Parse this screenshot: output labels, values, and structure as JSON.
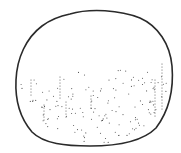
{
  "illustration": {
    "subject": "stippled round sphere drawing",
    "outline_color": "#2a2a2a",
    "dot_color": "#555555",
    "background": "#ffffff",
    "outline_path": "M70,14 C90,8 120,10 140,18 C158,26 170,44 172,66 C174,90 168,112 156,128 C142,142 118,146 90,146 C66,146 44,144 32,132 C20,118 15,100 16,80 C17,58 26,38 42,26 C50,20 60,16 70,14 Z",
    "dot_rows": [
      {
        "x": 31,
        "y0": 80,
        "y1": 96,
        "step": 3
      },
      {
        "x": 60,
        "y0": 77,
        "y1": 98,
        "step": 3
      },
      {
        "x": 91,
        "y0": 96,
        "y1": 110,
        "step": 3
      },
      {
        "x": 66,
        "y0": 102,
        "y1": 118,
        "step": 3
      },
      {
        "x": 44,
        "y0": 105,
        "y1": 122,
        "step": 3
      },
      {
        "x": 162,
        "y0": 64,
        "y1": 110,
        "step": 3
      },
      {
        "x": 155,
        "y0": 80,
        "y1": 118,
        "step": 3
      }
    ]
  }
}
